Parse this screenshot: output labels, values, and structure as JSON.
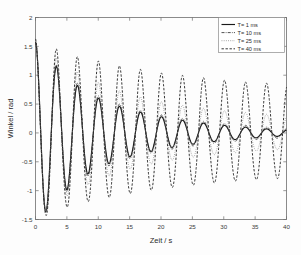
{
  "chart_data": {
    "type": "line",
    "title": "",
    "xlabel": "Zeit / s",
    "ylabel": "Winkel / rad",
    "xlim": [
      0,
      40
    ],
    "ylim": [
      -1.5,
      2
    ],
    "xticks": [
      0,
      5,
      10,
      15,
      20,
      25,
      30,
      35,
      40
    ],
    "xtick_labels": [
      "0",
      "5",
      "10",
      "15",
      "20",
      "25",
      "30",
      "35",
      "40"
    ],
    "yticks": [
      -1.5,
      -1,
      -0.5,
      0,
      0.5,
      1,
      1.5,
      2
    ],
    "ytick_labels": [
      "-1.5",
      "-1",
      "-0.5",
      "0",
      "0.5",
      "1",
      "1.5",
      "2"
    ],
    "grid": false,
    "legend_position": "top-right",
    "legend_entries": [
      {
        "label": "T=  1 ms",
        "style": "solid",
        "color": "#1a1a1a",
        "width": 1.15,
        "dash": "none"
      },
      {
        "label": "T= 10 ms",
        "style": "dash-dot",
        "color": "#303030",
        "width": 0.85,
        "dash": "3,1.2,0.8,1.2"
      },
      {
        "label": "T= 25 ms",
        "style": "dotted",
        "color": "#8c8c8c",
        "width": 0.85,
        "dash": "0.9,1.3"
      },
      {
        "label": "T= 40 ms",
        "style": "dashed",
        "color": "#2a2a2a",
        "width": 0.95,
        "dash": "2.4,1.6"
      }
    ],
    "series": [
      {
        "name": "T=  1 ms",
        "sampling_period_ms": 1,
        "initial_angle_rad": 1.57,
        "period_s": 3.35,
        "damping_per_period": 0.74,
        "envelope_peaks": [
          1.57,
          1.15,
          0.82,
          0.6,
          0.46,
          0.36,
          0.28,
          0.22,
          0.17,
          0.13,
          0.1,
          0.07,
          0.05,
          0.03,
          0.02
        ],
        "final_value_rad": 0.0
      },
      {
        "name": "T= 10 ms",
        "sampling_period_ms": 10,
        "initial_angle_rad": 1.57,
        "period_s": 3.35,
        "damping_per_period": 0.755,
        "envelope_peaks": [
          1.57,
          1.17,
          0.86,
          0.64,
          0.5,
          0.39,
          0.31,
          0.25,
          0.2,
          0.16,
          0.13,
          0.1,
          0.08,
          0.06,
          0.05
        ],
        "final_value_rad": 0.0
      },
      {
        "name": "T= 25 ms",
        "sampling_period_ms": 25,
        "initial_angle_rad": 1.57,
        "period_s": 3.35,
        "damping_per_period": 0.885,
        "envelope_peaks": [
          1.57,
          1.25,
          1.02,
          0.84,
          0.7,
          0.6,
          0.52,
          0.46,
          0.41,
          0.37,
          0.34,
          0.31,
          0.29,
          0.27,
          0.26
        ],
        "final_value_rad": 0.25
      },
      {
        "name": "T= 40 ms",
        "sampling_period_ms": 40,
        "initial_angle_rad": 1.57,
        "period_s": 3.35,
        "damping_per_period": 0.962,
        "envelope_peaks": [
          1.57,
          1.4,
          1.27,
          1.2,
          1.12,
          1.06,
          1.0,
          0.96,
          0.92,
          0.88,
          0.85,
          0.83,
          0.81,
          0.8,
          0.79
        ],
        "final_value_rad": 0.79
      }
    ]
  },
  "axes": {
    "x_label": "Zeit / s",
    "y_label": "Winkel / rad"
  },
  "colors": {
    "frame": "#6e6e6e",
    "background": "#fdfdfd",
    "text": "#2b2b2b"
  }
}
